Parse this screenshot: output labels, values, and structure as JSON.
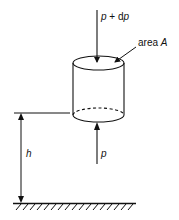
{
  "diagram": {
    "labels": {
      "top_force_p": "p",
      "top_force_plus": " + d",
      "top_force_dp": "p",
      "area_word": "area ",
      "area_symbol": "A",
      "height": "h",
      "bottom_force": "p"
    },
    "colors": {
      "stroke": "#111111",
      "background": "#ffffff"
    }
  }
}
